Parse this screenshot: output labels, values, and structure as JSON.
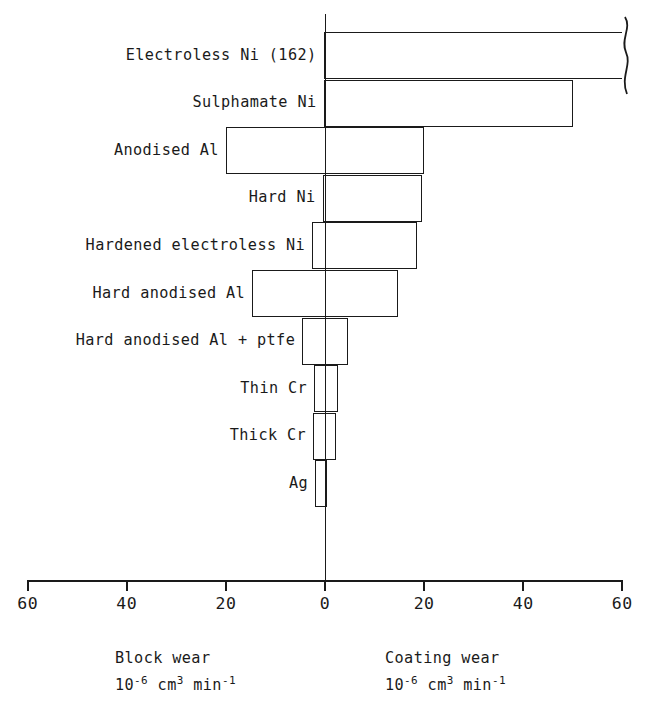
{
  "chart_data": {
    "type": "bar",
    "orientation": "horizontal-diverging",
    "title": "",
    "xlabel": "",
    "ylabel": "",
    "grid": false,
    "legend": "none",
    "axis": {
      "ticks_left": [
        "60",
        "40",
        "20"
      ],
      "center_tick": "0",
      "ticks_right": [
        "20",
        "40",
        "60"
      ],
      "all_tick_labels": [
        "60",
        "40",
        "20",
        "0",
        "20",
        "40",
        "60"
      ],
      "tick_values": [
        -60,
        -40,
        -20,
        0,
        20,
        40,
        60
      ],
      "xlim": [
        -60,
        60
      ]
    },
    "left_side_label": "Block wear",
    "left_side_units": "10-6 cm3 min-1",
    "right_side_label": "Coating wear",
    "right_side_units": "10-6 cm3 min-1",
    "categories": [
      "Electroless Ni (162)",
      "Sulphamate Ni",
      "Anodised Al",
      "Hard Ni",
      "Hardened electroless Ni",
      "Hard anodised Al",
      "Hard anodised Al + ptfe",
      "Thin Cr",
      "Thick Cr",
      "Ag"
    ],
    "series": [
      {
        "name": "Block wear",
        "units": "10^-6 cm^3 min^-1",
        "direction": "left",
        "values": [
          0.3,
          0.3,
          20.0,
          0.5,
          2.6,
          14.7,
          4.6,
          2.2,
          2.4,
          2.0
        ]
      },
      {
        "name": "Coating wear",
        "units": "10^-6 cm^3 min^-1",
        "direction": "right",
        "values": [
          162.0,
          50.0,
          20.0,
          19.5,
          18.5,
          14.7,
          4.6,
          2.6,
          2.2,
          0.3
        ]
      }
    ],
    "annotations": [
      {
        "category": "Electroless Ni (162)",
        "note": "Coating wear bar is truncated with an axis-break squiggle; actual value 162",
        "value": 162
      }
    ],
    "rows": [
      {
        "label": "Electroless Ni (162)",
        "block_wear": 0.3,
        "coating_wear": 162.0,
        "broken": true
      },
      {
        "label": "Sulphamate Ni",
        "block_wear": 0.3,
        "coating_wear": 50.0,
        "broken": false
      },
      {
        "label": "Anodised Al",
        "block_wear": 20.0,
        "coating_wear": 20.0,
        "broken": false
      },
      {
        "label": "Hard Ni",
        "block_wear": 0.5,
        "coating_wear": 19.5,
        "broken": false
      },
      {
        "label": "Hardened electroless Ni",
        "block_wear": 2.6,
        "coating_wear": 18.5,
        "broken": false
      },
      {
        "label": "Hard anodised Al",
        "block_wear": 14.7,
        "coating_wear": 14.7,
        "broken": false
      },
      {
        "label": "Hard anodised Al + ptfe",
        "block_wear": 4.6,
        "coating_wear": 4.6,
        "broken": false
      },
      {
        "label": "Thin Cr",
        "block_wear": 2.2,
        "coating_wear": 2.6,
        "broken": false
      },
      {
        "label": "Thick Cr",
        "block_wear": 2.4,
        "coating_wear": 2.2,
        "broken": false
      },
      {
        "label": "Ag",
        "block_wear": 2.0,
        "coating_wear": 0.3,
        "broken": false
      }
    ]
  },
  "captions": {
    "left": {
      "title": "Block wear",
      "units_base": "10",
      "units_exp1": "-6",
      "units_mid": " cm",
      "units_exp2": "3",
      "units_mid2": " min",
      "units_exp3": "-1"
    },
    "right": {
      "title": "Coating wear",
      "units_base": "10",
      "units_exp1": "-6",
      "units_mid": " cm",
      "units_exp2": "3",
      "units_mid2": " min",
      "units_exp3": "-1"
    }
  },
  "style": {
    "line_color": "#1a1a1a",
    "background": "#ffffff"
  }
}
